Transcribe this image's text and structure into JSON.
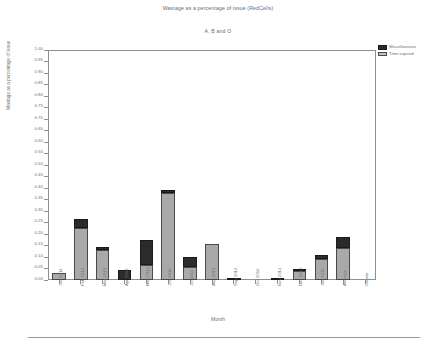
{
  "chart_data": {
    "type": "bar",
    "stacked": true,
    "title": "Wastage as a percentage of issue (RedCells)",
    "subtitle": "A, B and O",
    "xlabel": "Month",
    "ylabel": "Wastage as a percentage of issue",
    "ylim": [
      0.0,
      1.0
    ],
    "ytick_step": 0.05,
    "grid": false,
    "legend_position": "top-right",
    "ytick_labels": [
      "1.00",
      "0.95",
      "0.90",
      "0.85",
      "0.80",
      "0.75",
      "0.70",
      "0.65",
      "0.60",
      "0.55",
      "0.50",
      "0.45",
      "0.40",
      "0.35",
      "0.30",
      "0.25",
      "0.20",
      "0.15",
      "0.10",
      "0.05",
      "0.00"
    ],
    "categories": [
      "Jan 2014",
      "Feb 2014",
      "Mar 2014",
      "Apr 2014",
      "May 2014",
      "Jun 2014",
      "Jul 2014",
      "Aug 2014",
      "Sep 2014",
      "Oct 2014",
      "Nov 2014",
      "Dec 2014",
      "Jan 2015",
      "Average",
      "Cluster"
    ],
    "series": [
      {
        "name": "Time expired",
        "color": "#a9a9a9",
        "values": [
          0.03,
          0.225,
          0.13,
          0.0,
          0.065,
          0.38,
          0.055,
          0.155,
          0.0,
          0.0,
          0.0,
          0.04,
          0.09,
          0.14,
          0.0
        ]
      },
      {
        "name": "Miscellaneous",
        "color": "#2b2b2b",
        "values": [
          0.0,
          0.04,
          0.015,
          0.045,
          0.11,
          0.01,
          0.045,
          0.0,
          0.01,
          0.0,
          0.008,
          0.01,
          0.02,
          0.045,
          0.0
        ]
      }
    ],
    "totals": [
      0.03,
      0.265,
      0.145,
      0.045,
      0.175,
      0.39,
      0.1,
      0.155,
      0.01,
      0.0,
      0.008,
      0.05,
      0.11,
      0.185,
      0.0
    ]
  },
  "legend": {
    "items": [
      {
        "label": "Miscellaneous",
        "swatch": "misc"
      },
      {
        "label": "Time expired",
        "swatch": "exp"
      }
    ]
  }
}
